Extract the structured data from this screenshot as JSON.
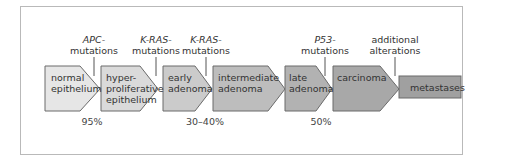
{
  "diagram": {
    "stages": [
      {
        "label_line1": "normal",
        "label_line2": "epithelium",
        "label_line3": "",
        "fill": "#e6e6e6"
      },
      {
        "label_line1": "hyper-",
        "label_line2": "proliferative",
        "label_line3": "epithelium",
        "fill": "#dadada"
      },
      {
        "label_line1": "early",
        "label_line2": "adenoma",
        "label_line3": "",
        "fill": "#cbcbcb"
      },
      {
        "label_line1": "intermediate",
        "label_line2": "adenoma",
        "label_line3": "",
        "fill": "#bdbdbd"
      },
      {
        "label_line1": "late",
        "label_line2": "adenoma",
        "label_line3": "",
        "fill": "#b2b2b2"
      },
      {
        "label_line1": "carcinoma",
        "label_line2": "",
        "label_line3": "",
        "fill": "#a8a8a8"
      },
      {
        "label_line1": "metastases",
        "label_line2": "",
        "label_line3": "",
        "fill": "#a0a0a0"
      }
    ],
    "mutations": [
      {
        "line1": "APC-",
        "line2": "mutations",
        "italic": true
      },
      {
        "line1": "K-RAS-",
        "line2": "mutations",
        "italic": true
      },
      {
        "line1": "K-RAS-",
        "line2": "mutations",
        "italic": true
      },
      {
        "line1": "P53-",
        "line2": "mutations",
        "italic": true
      },
      {
        "line1": "additional",
        "line2": "alterations",
        "italic": false
      }
    ],
    "percentages": [
      "95%",
      "30–40%",
      "50%"
    ],
    "colors": {
      "stroke": "#6a6a6a",
      "frame": "#b9b9b9",
      "text": "#333333"
    }
  }
}
